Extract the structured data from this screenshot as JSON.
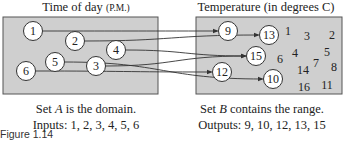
{
  "domain_set": {
    "title": "Time of day",
    "title_unit": "(P.M.)",
    "caption_line1_prefix": "Set ",
    "caption_var": "A",
    "caption_line1_suffix": " is the domain.",
    "caption_line2": "Inputs: 1, 2, 3, 4, 5, 6",
    "inputs": [
      {
        "label": "1",
        "x": 33,
        "y": 31
      },
      {
        "label": "2",
        "x": 75,
        "y": 41
      },
      {
        "label": "4",
        "x": 116,
        "y": 50
      },
      {
        "label": "5",
        "x": 55,
        "y": 62
      },
      {
        "label": "3",
        "x": 96,
        "y": 66
      },
      {
        "label": "6",
        "x": 26,
        "y": 71
      }
    ]
  },
  "range_set": {
    "title": "Temperature (in degrees C)",
    "caption_line1_prefix": "Set ",
    "caption_var": "B",
    "caption_line1_suffix": " contains the range.",
    "caption_line2": "Outputs: 9, 10, 12, 13, 15",
    "outputs": [
      {
        "label": "9",
        "x": 228,
        "y": 31
      },
      {
        "label": "13",
        "x": 269,
        "y": 35
      },
      {
        "label": "15",
        "x": 256,
        "y": 56
      },
      {
        "label": "12",
        "x": 222,
        "y": 72
      },
      {
        "label": "10",
        "x": 273,
        "y": 79
      }
    ],
    "other_values": [
      {
        "label": "1",
        "x": 288,
        "y": 31
      },
      {
        "label": "3",
        "x": 307,
        "y": 36
      },
      {
        "label": "2",
        "x": 332,
        "y": 35
      },
      {
        "label": "6",
        "x": 280,
        "y": 59
      },
      {
        "label": "4",
        "x": 295,
        "y": 53
      },
      {
        "label": "5",
        "x": 327,
        "y": 52
      },
      {
        "label": "7",
        "x": 316,
        "y": 63
      },
      {
        "label": "8",
        "x": 334,
        "y": 67
      },
      {
        "label": "14",
        "x": 303,
        "y": 70
      },
      {
        "label": "16",
        "x": 304,
        "y": 87
      },
      {
        "label": "11",
        "x": 327,
        "y": 85
      }
    ]
  },
  "mappings": [
    {
      "from": "1",
      "to": "9"
    },
    {
      "from": "2",
      "to": "13"
    },
    {
      "from": "4",
      "to": "15"
    },
    {
      "from": "3",
      "to": "15"
    },
    {
      "from": "5",
      "to": "10"
    },
    {
      "from": "6",
      "to": "12"
    }
  ],
  "figure_label": "Figure 1.14",
  "colors": {
    "box_fill": "#cfcfcf",
    "box_stroke": "#555555",
    "circle_fill": "#ffffff",
    "line": "#333333"
  }
}
